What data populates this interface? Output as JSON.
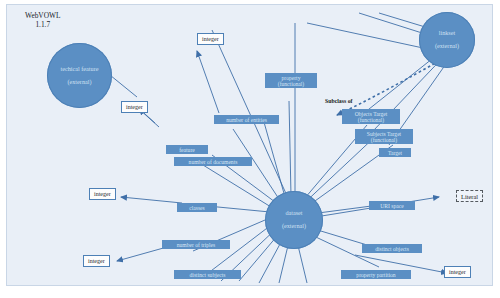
{
  "app": {
    "name": "WebVOWL",
    "version": "1.1.7"
  },
  "colors": {
    "node_fill": "#5b8fc4",
    "node_stroke": "#4d80b6",
    "property_fill": "#5b8fc4",
    "property_text": "#d8e6f5",
    "datatype_fill": "#fdfdfd",
    "datatype_stroke": "#4d80b6",
    "edge": "#3f6fa8",
    "canvas_background": "#e9eff7"
  },
  "graph": {
    "classes": [
      {
        "id": "techical-feature",
        "label": "techical feature",
        "sublabel": "(external)"
      },
      {
        "id": "dataset",
        "label": "dataset",
        "sublabel": "(external)"
      },
      {
        "id": "linkset",
        "label": "linkset",
        "sublabel": "(external)"
      }
    ],
    "datatypes": [
      {
        "id": "integer-1",
        "label": "integer"
      },
      {
        "id": "integer-2",
        "label": "integer"
      },
      {
        "id": "integer-3",
        "label": "integer"
      },
      {
        "id": "integer-4",
        "label": "integer"
      },
      {
        "id": "integer-5",
        "label": "integer"
      },
      {
        "id": "integer-6",
        "label": "integer"
      }
    ],
    "literal": {
      "id": "literal",
      "label": "Literal"
    },
    "properties": [
      {
        "id": "property-functional",
        "label": "property",
        "sublabel": "(functional)"
      },
      {
        "id": "number-of-entities",
        "label": "number of entities",
        "sublabel": ""
      },
      {
        "id": "feature",
        "label": "feature",
        "sublabel": ""
      },
      {
        "id": "number-of-documents",
        "label": "number of documents",
        "sublabel": ""
      },
      {
        "id": "classes",
        "label": "classes",
        "sublabel": ""
      },
      {
        "id": "number-of-triples",
        "label": "number of triples",
        "sublabel": ""
      },
      {
        "id": "distinct-subjects",
        "label": "distinct subjects",
        "sublabel": ""
      },
      {
        "id": "distinct-objects",
        "label": "distinct objects",
        "sublabel": ""
      },
      {
        "id": "property-partition",
        "label": "property partition",
        "sublabel": ""
      },
      {
        "id": "uri-space",
        "label": "URI space",
        "sublabel": ""
      },
      {
        "id": "objects-target-functional",
        "label": "Objects Target",
        "sublabel": "(functional)"
      },
      {
        "id": "subjects-target-functional",
        "label": "Subjects Target",
        "sublabel": "(functional)"
      },
      {
        "id": "target",
        "label": "Target",
        "sublabel": ""
      }
    ],
    "annotations": [
      {
        "id": "subclass-of",
        "label": "Subclass of"
      }
    ]
  }
}
